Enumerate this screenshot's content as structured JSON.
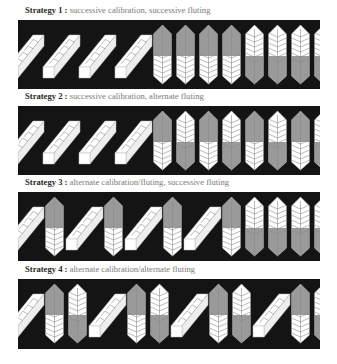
{
  "figure": {
    "colors": {
      "panel_background": "#141414",
      "blank_fill": "#ffffff",
      "flute_gray": "#9a9a9a",
      "line": "#8a8a8a",
      "caption_label": "#2a2a2a",
      "caption_text": "#7a7a7a"
    },
    "strategies": [
      {
        "label": "Strategy 1 :",
        "description": "successive calibration, successive fluting",
        "sequence": [
          "blank",
          "blank",
          "blank",
          "blank",
          "fluted-gray-top",
          "fluted-gray-top",
          "fluted-gray-top",
          "fluted-gray-top",
          "fluted-white-top",
          "fluted-white-top",
          "fluted-white-top",
          "fluted-white-top"
        ]
      },
      {
        "label": "Strategy 2 :",
        "description": "successive calibration, alternate fluting",
        "sequence": [
          "blank",
          "blank",
          "blank",
          "blank",
          "fluted-gray-top",
          "fluted-white-top",
          "fluted-gray-top",
          "fluted-white-top",
          "fluted-gray-top",
          "fluted-white-top",
          "fluted-gray-top",
          "fluted-white-top"
        ]
      },
      {
        "label": "Strategy 3 :",
        "description": "alternate calibration/fluting, successive fluting",
        "sequence": [
          "blank",
          "fluted-gray-top",
          "blank",
          "fluted-gray-top",
          "blank",
          "fluted-gray-top",
          "blank",
          "fluted-gray-top",
          "fluted-white-top",
          "fluted-white-top",
          "fluted-white-top",
          "fluted-white-top"
        ]
      },
      {
        "label": "Strategy 4 :",
        "description": "alternate calibration/alternate fluting",
        "sequence": [
          "blank",
          "fluted-gray-top",
          "fluted-white-top",
          "blank",
          "fluted-gray-top",
          "fluted-white-top",
          "blank",
          "fluted-gray-top",
          "fluted-white-top",
          "blank",
          "fluted-gray-top",
          "fluted-white-top"
        ]
      }
    ]
  }
}
